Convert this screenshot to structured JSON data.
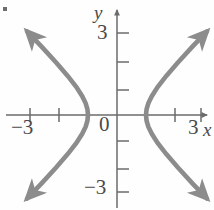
{
  "figure": {
    "kind": "coordinate-plane-graph",
    "background_color": "#fefefe",
    "axis_color": "#6b6b6b",
    "curve_color": "#8c8c8c",
    "label_color": "#4a4a4a"
  },
  "labels": {
    "y_axis_name": "y",
    "x_axis_name": "x",
    "y_top_tick": "3",
    "y_bottom_tick": "−3",
    "origin": "0",
    "x_left_tick": "−3",
    "x_right_tick": "3"
  },
  "chart_data": {
    "type": "line",
    "title": "",
    "xlabel": "x",
    "ylabel": "y",
    "xlim": [
      -3.9,
      3.3
    ],
    "ylim": [
      -3.6,
      3.6
    ],
    "xticks": [
      -3,
      -2,
      -1,
      1,
      2,
      3
    ],
    "yticks": [
      -3,
      -2,
      -1,
      1,
      2,
      3
    ],
    "xtick_labels": [
      "−3",
      "",
      "",
      "",
      "",
      "3"
    ],
    "ytick_labels": [
      "−3",
      "",
      "",
      "",
      "",
      "3"
    ],
    "grid": false,
    "legend": null,
    "axis_arrows": [
      "x-right",
      "y-up"
    ],
    "annotations": [],
    "series": [
      {
        "name": "right branch",
        "equation": "x^2 - y^2 = 1, x >= 1",
        "vertex": [
          1,
          0
        ],
        "x": [
          1.0,
          1.02,
          1.08,
          1.2,
          1.4,
          1.7,
          2.1,
          2.6,
          3.1
        ],
        "y_upper": [
          0.0,
          0.2,
          0.41,
          0.66,
          0.98,
          1.37,
          1.84,
          2.4,
          2.93
        ],
        "y_lower": [
          0.0,
          -0.2,
          -0.41,
          -0.66,
          -0.98,
          -1.37,
          -1.84,
          -2.4,
          -2.93
        ],
        "arrowheads": [
          "upper-end",
          "lower-end"
        ]
      },
      {
        "name": "left branch",
        "equation": "x^2 - y^2 = 1, x <= -1",
        "vertex": [
          -1,
          0
        ],
        "x": [
          -1.0,
          -1.02,
          -1.08,
          -1.2,
          -1.4,
          -1.7,
          -2.1,
          -2.6,
          -3.1
        ],
        "y_upper": [
          0.0,
          0.2,
          0.41,
          0.66,
          0.98,
          1.37,
          1.84,
          2.4,
          2.93
        ],
        "y_lower": [
          0.0,
          -0.2,
          -0.41,
          -0.66,
          -0.98,
          -1.37,
          -1.84,
          -2.4,
          -2.93
        ],
        "arrowheads": [
          "upper-end",
          "lower-end"
        ]
      }
    ]
  }
}
